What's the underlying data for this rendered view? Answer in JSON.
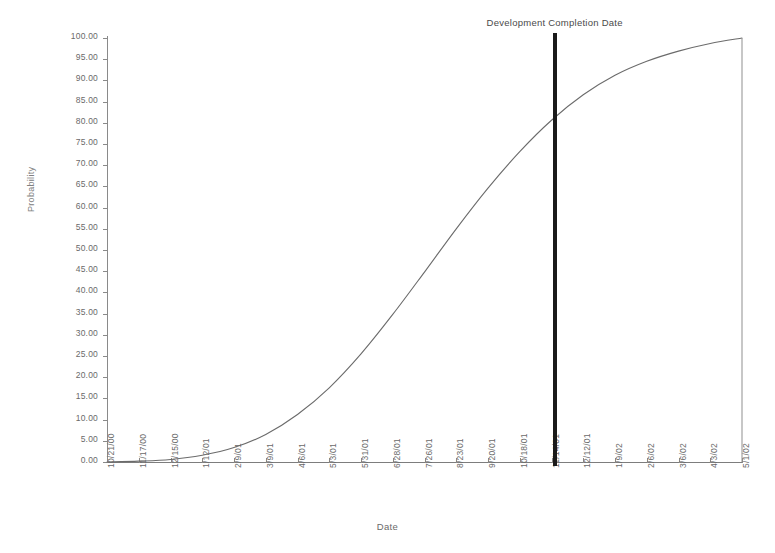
{
  "chart_data": {
    "type": "line",
    "title": "",
    "xlabel": "Date",
    "ylabel": "Probability",
    "ylim": [
      0,
      100
    ],
    "grid": false,
    "legend": "none",
    "y_ticks": [
      "0.00",
      "5.00",
      "10.00",
      "15.00",
      "20.00",
      "25.00",
      "30.00",
      "35.00",
      "40.00",
      "45.00",
      "50.00",
      "55.00",
      "60.00",
      "65.00",
      "70.00",
      "75.00",
      "80.00",
      "85.00",
      "90.00",
      "95.00",
      "100.00"
    ],
    "categories": [
      "10/21/00",
      "11/17/00",
      "12/15/00",
      "1/12/01",
      "2/9/01",
      "3/9/01",
      "4/6/01",
      "5/3/01",
      "5/31/01",
      "6/28/01",
      "7/26/01",
      "8/23/01",
      "9/20/01",
      "10/18/01",
      "11/14/01",
      "12/12/01",
      "1/9/02",
      "2/6/02",
      "3/6/02",
      "4/3/02",
      "5/1/02"
    ],
    "series": [
      {
        "name": "Cumulative Probability",
        "values": [
          0.0,
          0.2,
          0.6,
          1.6,
          3.4,
          6.5,
          11.2,
          17.5,
          25.5,
          34.8,
          44.8,
          55.0,
          64.6,
          73.2,
          80.6,
          86.6,
          91.2,
          94.5,
          96.9,
          98.7,
          100.0
        ]
      }
    ],
    "annotations": [
      {
        "name": "development-completion-date",
        "label": "Development Completion Date",
        "x_value": "11/1/01",
        "x_index": 14.1,
        "probability_at_marker": 80.0,
        "style": "vertical-line",
        "color": "#1a1a1a"
      }
    ],
    "colors": {
      "curve": "#6b6b6b",
      "axis": "#8a8a8a",
      "text": "#6a6a6a",
      "marker": "#1a1a1a",
      "background": "#ffffff"
    }
  }
}
